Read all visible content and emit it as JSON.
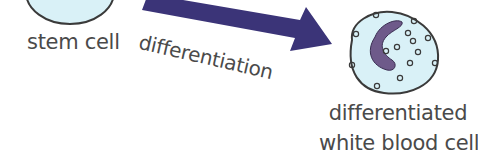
{
  "diagram": {
    "nodes": [
      {
        "id": "stem-cell",
        "label": "stem cell"
      },
      {
        "id": "white-blood-cell",
        "label_lines": [
          "differentiated",
          "white blood cell"
        ]
      }
    ],
    "edges": [
      {
        "from": "stem-cell",
        "to": "white-blood-cell",
        "label": "differentiation"
      }
    ],
    "colors": {
      "cell_fill": "#d9f1f7",
      "cell_outline": "#3a3a3a",
      "arrow": "#3b3478",
      "nucleus": "#6e5a8a",
      "text": "#4a4a4a"
    }
  }
}
